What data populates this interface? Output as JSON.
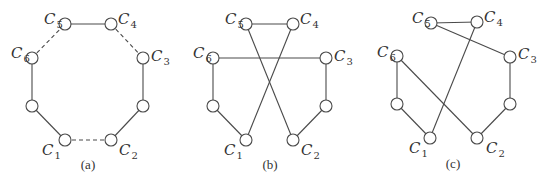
{
  "figure": {
    "node_radius": 6,
    "edge_color": "#4a4a4a",
    "panels": [
      {
        "id": "a",
        "caption": "(a)",
        "caption_pos": [
          88,
          158
        ],
        "nodes": [
          {
            "id": "C1",
            "x": 65,
            "y": 140,
            "label": "C",
            "sub": "1",
            "label_pos": [
              42,
              143
            ]
          },
          {
            "id": "C2",
            "x": 111,
            "y": 140,
            "label": "C",
            "sub": "2",
            "label_pos": [
              119,
              143
            ]
          },
          {
            "id": "C3",
            "x": 143,
            "y": 58,
            "label": "C",
            "sub": "3",
            "label_pos": [
              151,
              49
            ]
          },
          {
            "id": "C4",
            "x": 111,
            "y": 24,
            "label": "C",
            "sub": "4",
            "label_pos": [
              118,
              12
            ]
          },
          {
            "id": "C5",
            "x": 65,
            "y": 24,
            "label": "C",
            "sub": "5",
            "label_pos": [
              44,
              12
            ]
          },
          {
            "id": "C6",
            "x": 32,
            "y": 58,
            "label": "C",
            "sub": "6",
            "label_pos": [
              11,
              46
            ]
          },
          {
            "id": "L",
            "x": 32,
            "y": 106,
            "label": "",
            "sub": ""
          },
          {
            "id": "R",
            "x": 143,
            "y": 106,
            "label": "",
            "sub": ""
          }
        ],
        "edges": [
          {
            "from": "C5",
            "to": "C4",
            "style": "solid"
          },
          {
            "from": "C4",
            "to": "C3",
            "style": "dashed"
          },
          {
            "from": "C3",
            "to": "R",
            "style": "solid"
          },
          {
            "from": "R",
            "to": "C2",
            "style": "solid"
          },
          {
            "from": "C2",
            "to": "C1",
            "style": "dashed"
          },
          {
            "from": "C1",
            "to": "L",
            "style": "solid"
          },
          {
            "from": "L",
            "to": "C6",
            "style": "solid"
          },
          {
            "from": "C6",
            "to": "C5",
            "style": "dashed"
          }
        ]
      },
      {
        "id": "b",
        "caption": "(b)",
        "caption_pos": [
          270,
          158
        ],
        "nodes": [
          {
            "id": "C1",
            "x": 246,
            "y": 140,
            "label": "C",
            "sub": "1",
            "label_pos": [
              224,
              143
            ]
          },
          {
            "id": "C2",
            "x": 293,
            "y": 140,
            "label": "C",
            "sub": "2",
            "label_pos": [
              301,
              143
            ]
          },
          {
            "id": "C3",
            "x": 326,
            "y": 58,
            "label": "C",
            "sub": "3",
            "label_pos": [
              334,
              49
            ]
          },
          {
            "id": "C4",
            "x": 293,
            "y": 24,
            "label": "C",
            "sub": "4",
            "label_pos": [
              300,
              12
            ]
          },
          {
            "id": "C5",
            "x": 246,
            "y": 24,
            "label": "C",
            "sub": "5",
            "label_pos": [
              225,
              12
            ]
          },
          {
            "id": "C6",
            "x": 213,
            "y": 58,
            "label": "C",
            "sub": "6",
            "label_pos": [
              193,
              46
            ]
          },
          {
            "id": "L",
            "x": 213,
            "y": 106,
            "label": "",
            "sub": ""
          },
          {
            "id": "R",
            "x": 326,
            "y": 106,
            "label": "",
            "sub": ""
          }
        ],
        "edges": [
          {
            "from": "C5",
            "to": "C4",
            "style": "solid"
          },
          {
            "from": "C6",
            "to": "C3",
            "style": "solid"
          },
          {
            "from": "C5",
            "to": "C2",
            "style": "solid"
          },
          {
            "from": "C4",
            "to": "C1",
            "style": "solid"
          },
          {
            "from": "C6",
            "to": "L",
            "style": "solid"
          },
          {
            "from": "L",
            "to": "C1",
            "style": "solid"
          },
          {
            "from": "C3",
            "to": "R",
            "style": "solid"
          },
          {
            "from": "R",
            "to": "C2",
            "style": "solid"
          }
        ]
      },
      {
        "id": "c",
        "caption": "(c)",
        "caption_pos": [
          453,
          157
        ],
        "nodes": [
          {
            "id": "C1",
            "x": 430,
            "y": 138,
            "label": "C",
            "sub": "1",
            "label_pos": [
              409,
              141
            ]
          },
          {
            "id": "C2",
            "x": 477,
            "y": 138,
            "label": "C",
            "sub": "2",
            "label_pos": [
              486,
              141
            ]
          },
          {
            "id": "C3",
            "x": 510,
            "y": 57,
            "label": "C",
            "sub": "3",
            "label_pos": [
              518,
              47
            ]
          },
          {
            "id": "C4",
            "x": 477,
            "y": 22,
            "label": "C",
            "sub": "4",
            "label_pos": [
              484,
              10
            ]
          },
          {
            "id": "C5",
            "x": 431,
            "y": 23,
            "label": "C",
            "sub": "5",
            "label_pos": [
              412,
              11
            ]
          },
          {
            "id": "C6",
            "x": 397,
            "y": 56,
            "label": "C",
            "sub": "6",
            "label_pos": [
              377,
              45
            ]
          },
          {
            "id": "L",
            "x": 397,
            "y": 104,
            "label": "",
            "sub": ""
          },
          {
            "id": "R",
            "x": 510,
            "y": 104,
            "label": "",
            "sub": ""
          }
        ],
        "edges": [
          {
            "from": "C5",
            "to": "C4",
            "style": "solid"
          },
          {
            "from": "C5",
            "to": "C3",
            "style": "solid"
          },
          {
            "from": "C4",
            "to": "C1",
            "style": "solid"
          },
          {
            "from": "C6",
            "to": "C2",
            "style": "solid"
          },
          {
            "from": "C6",
            "to": "L",
            "style": "solid"
          },
          {
            "from": "L",
            "to": "C1",
            "style": "solid"
          },
          {
            "from": "C3",
            "to": "R",
            "style": "solid"
          },
          {
            "from": "R",
            "to": "C2",
            "style": "solid"
          }
        ]
      }
    ]
  }
}
